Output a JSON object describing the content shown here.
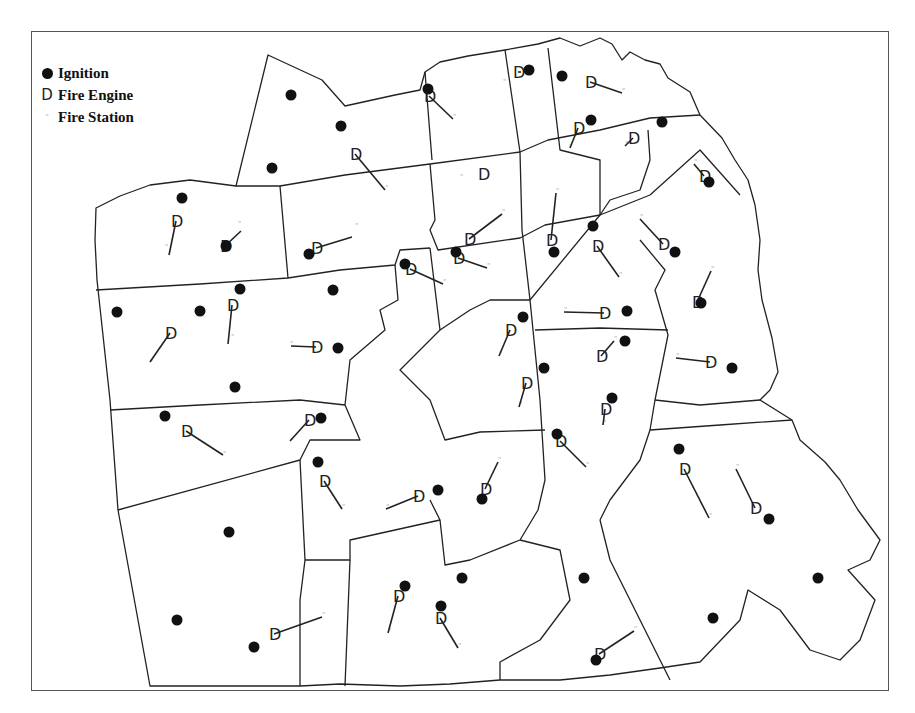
{
  "legend": {
    "items": [
      {
        "symbol": "ignition-dot",
        "label": "Ignition"
      },
      {
        "symbol": "D",
        "label": "Fire Engine"
      },
      {
        "symbol": "\"",
        "label": "Fire Station"
      }
    ]
  },
  "colors": {
    "boundary": "#222222",
    "ignition": "#111111",
    "engine": "#222222",
    "station": "#aaaaaa",
    "frame": "#555555",
    "background": "#ffffff"
  },
  "ignitions": [
    [
      291,
      95
    ],
    [
      341,
      126
    ],
    [
      272,
      168
    ],
    [
      182,
      198
    ],
    [
      226,
      246
    ],
    [
      117,
      312
    ],
    [
      200,
      311
    ],
    [
      240,
      289
    ],
    [
      333,
      290
    ],
    [
      338,
      348
    ],
    [
      235,
      387
    ],
    [
      165,
      416
    ],
    [
      321,
      418
    ],
    [
      318,
      462
    ],
    [
      229,
      532
    ],
    [
      177,
      620
    ],
    [
      254,
      647
    ],
    [
      405,
      586
    ],
    [
      441,
      606
    ],
    [
      462,
      578
    ],
    [
      584,
      578
    ],
    [
      596,
      660
    ],
    [
      428,
      89
    ],
    [
      529,
      70
    ],
    [
      562,
      76
    ],
    [
      591,
      120
    ],
    [
      662,
      122
    ],
    [
      709,
      182
    ],
    [
      675,
      252
    ],
    [
      593,
      226
    ],
    [
      554,
      252
    ],
    [
      456,
      252
    ],
    [
      405,
      264
    ],
    [
      309,
      254
    ],
    [
      523,
      317
    ],
    [
      544,
      368
    ],
    [
      627,
      311
    ],
    [
      625,
      341
    ],
    [
      612,
      398
    ],
    [
      557,
      434
    ],
    [
      701,
      303
    ],
    [
      732,
      368
    ],
    [
      679,
      449
    ],
    [
      769,
      519
    ],
    [
      818,
      578
    ],
    [
      713,
      618
    ],
    [
      438,
      490
    ],
    [
      482,
      499
    ]
  ],
  "engines": [
    {
      "x": 176,
      "y": 221,
      "sx": 169,
      "sy": 255
    },
    {
      "x": 225,
      "y": 246,
      "sx": 241,
      "sy": 231
    },
    {
      "x": 316,
      "y": 248,
      "sx": 352,
      "sy": 237
    },
    {
      "x": 232,
      "y": 305,
      "sx": 228,
      "sy": 344
    },
    {
      "x": 170,
      "y": 333,
      "sx": 150,
      "sy": 362
    },
    {
      "x": 316,
      "y": 347,
      "sx": 291,
      "sy": 346
    },
    {
      "x": 186,
      "y": 431,
      "sx": 223,
      "sy": 455
    },
    {
      "x": 309,
      "y": 420,
      "sx": 290,
      "sy": 441
    },
    {
      "x": 324,
      "y": 481,
      "sx": 342,
      "sy": 509
    },
    {
      "x": 274,
      "y": 634,
      "sx": 322,
      "sy": 617
    },
    {
      "x": 398,
      "y": 596,
      "sx": 388,
      "sy": 633
    },
    {
      "x": 440,
      "y": 618,
      "sx": 458,
      "sy": 648
    },
    {
      "x": 599,
      "y": 654,
      "sx": 634,
      "sy": 631
    },
    {
      "x": 355,
      "y": 154,
      "sx": 385,
      "sy": 190
    },
    {
      "x": 429,
      "y": 96,
      "sx": 453,
      "sy": 119
    },
    {
      "x": 518,
      "y": 72,
      "sx": 521,
      "sy": 72
    },
    {
      "x": 590,
      "y": 82,
      "sx": 622,
      "sy": 93
    },
    {
      "x": 578,
      "y": 128,
      "sx": 570,
      "sy": 148
    },
    {
      "x": 633,
      "y": 138,
      "sx": 625,
      "sy": 146
    },
    {
      "x": 483,
      "y": 174,
      "sx": 483,
      "sy": 174
    },
    {
      "x": 469,
      "y": 239,
      "sx": 502,
      "sy": 214
    },
    {
      "x": 551,
      "y": 240,
      "sx": 556,
      "sy": 193
    },
    {
      "x": 597,
      "y": 246,
      "sx": 619,
      "sy": 277
    },
    {
      "x": 663,
      "y": 244,
      "sx": 640,
      "sy": 219
    },
    {
      "x": 704,
      "y": 176,
      "sx": 694,
      "sy": 164
    },
    {
      "x": 410,
      "y": 269,
      "sx": 443,
      "sy": 284
    },
    {
      "x": 458,
      "y": 258,
      "sx": 487,
      "sy": 268
    },
    {
      "x": 510,
      "y": 330,
      "sx": 499,
      "sy": 356
    },
    {
      "x": 526,
      "y": 383,
      "sx": 519,
      "sy": 407
    },
    {
      "x": 604,
      "y": 313,
      "sx": 564,
      "sy": 312
    },
    {
      "x": 697,
      "y": 302,
      "sx": 711,
      "sy": 271
    },
    {
      "x": 710,
      "y": 362,
      "sx": 676,
      "sy": 358
    },
    {
      "x": 605,
      "y": 409,
      "sx": 603,
      "sy": 425
    },
    {
      "x": 601,
      "y": 356,
      "sx": 614,
      "sy": 341
    },
    {
      "x": 560,
      "y": 441,
      "sx": 586,
      "sy": 467
    },
    {
      "x": 684,
      "y": 469,
      "sx": 709,
      "sy": 518
    },
    {
      "x": 755,
      "y": 508,
      "sx": 736,
      "sy": 469
    },
    {
      "x": 418,
      "y": 496,
      "sx": 386,
      "sy": 509
    },
    {
      "x": 485,
      "y": 489,
      "sx": 498,
      "sy": 462
    }
  ],
  "stations": [
    [
      165,
      249
    ],
    [
      238,
      226
    ],
    [
      355,
      228
    ],
    [
      231,
      339
    ],
    [
      150,
      364
    ],
    [
      290,
      346
    ],
    [
      223,
      456
    ],
    [
      290,
      443
    ],
    [
      342,
      509
    ],
    [
      322,
      617
    ],
    [
      388,
      633
    ],
    [
      458,
      648
    ],
    [
      634,
      631
    ],
    [
      385,
      190
    ],
    [
      453,
      119
    ],
    [
      503,
      84
    ],
    [
      622,
      93
    ],
    [
      569,
      149
    ],
    [
      625,
      146
    ],
    [
      460,
      179
    ],
    [
      502,
      214
    ],
    [
      556,
      193
    ],
    [
      619,
      277
    ],
    [
      640,
      219
    ],
    [
      694,
      164
    ],
    [
      443,
      284
    ],
    [
      487,
      268
    ],
    [
      499,
      356
    ],
    [
      519,
      407
    ],
    [
      564,
      312
    ],
    [
      711,
      271
    ],
    [
      676,
      358
    ],
    [
      603,
      425
    ],
    [
      614,
      341
    ],
    [
      586,
      467
    ],
    [
      709,
      518
    ],
    [
      736,
      469
    ],
    [
      386,
      509
    ],
    [
      498,
      462
    ]
  ]
}
